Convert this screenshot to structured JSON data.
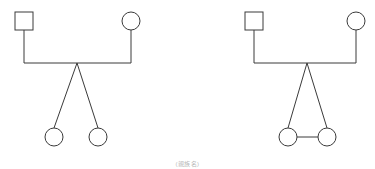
{
  "page": {
    "background_color": "#ffffff",
    "line_color": "#3a3a3a",
    "shape_fill": "#ffffff",
    "width": 375,
    "height": 169
  },
  "caption": {
    "text": "(親族名)",
    "color": "#b9b9b9"
  },
  "diagrams": [
    {
      "id": "left-diagram",
      "name": "diagram-left",
      "label": "Two unrelated daughters",
      "nodes": [
        {
          "id": "father",
          "name": "father-square",
          "symbol": "square",
          "sex": "male",
          "cx": 24,
          "cy": 21,
          "size": 18
        },
        {
          "id": "mother",
          "name": "mother-circle",
          "symbol": "circle",
          "sex": "female",
          "cx": 131,
          "cy": 21,
          "r": 9
        },
        {
          "id": "child1",
          "name": "child-1-circle",
          "symbol": "circle",
          "sex": "female",
          "cx": 54,
          "cy": 137,
          "r": 9
        },
        {
          "id": "child2",
          "name": "child-2-circle",
          "symbol": "circle",
          "sex": "female",
          "cx": 98,
          "cy": 137,
          "r": 9
        }
      ],
      "links": [
        {
          "id": "father-drop",
          "name": "father-descent-line",
          "type": "vertical",
          "x": 24,
          "y1": 30,
          "y2": 63
        },
        {
          "id": "mother-drop",
          "name": "mother-descent-line",
          "type": "vertical",
          "x": 131,
          "y1": 30,
          "y2": 63
        },
        {
          "id": "union-line",
          "name": "marriage-line",
          "type": "horizontal",
          "y": 63,
          "x1": 24,
          "x2": 131
        },
        {
          "id": "sib-1",
          "name": "sibling-line-1",
          "type": "diagonal",
          "x1": 77,
          "y1": 63,
          "x2": 54,
          "y2": 128
        },
        {
          "id": "sib-2",
          "name": "sibling-line-2",
          "type": "diagonal",
          "x1": 77,
          "y1": 63,
          "x2": 98,
          "y2": 128
        }
      ]
    },
    {
      "id": "right-diagram",
      "name": "diagram-right",
      "label": "Two daughters joined by a union line",
      "nodes": [
        {
          "id": "father",
          "name": "father-square",
          "symbol": "square",
          "sex": "male",
          "cx": 254,
          "cy": 21,
          "size": 18
        },
        {
          "id": "mother",
          "name": "mother-circle",
          "symbol": "circle",
          "sex": "female",
          "cx": 356,
          "cy": 21,
          "r": 9
        },
        {
          "id": "child1",
          "name": "child-1-circle",
          "symbol": "circle",
          "sex": "female",
          "cx": 288,
          "cy": 137,
          "r": 9
        },
        {
          "id": "child2",
          "name": "child-2-circle",
          "symbol": "circle",
          "sex": "female",
          "cx": 327,
          "cy": 137,
          "r": 9
        }
      ],
      "links": [
        {
          "id": "father-drop",
          "name": "father-descent-line",
          "type": "vertical",
          "x": 254,
          "y1": 30,
          "y2": 63
        },
        {
          "id": "mother-drop",
          "name": "mother-descent-line",
          "type": "vertical",
          "x": 356,
          "y1": 30,
          "y2": 63
        },
        {
          "id": "union-line",
          "name": "marriage-line",
          "type": "horizontal",
          "y": 63,
          "x1": 254,
          "x2": 356
        },
        {
          "id": "sib-1",
          "name": "sibling-line-1",
          "type": "diagonal",
          "x1": 307,
          "y1": 63,
          "x2": 288,
          "y2": 128
        },
        {
          "id": "sib-2",
          "name": "sibling-line-2",
          "type": "diagonal",
          "x1": 307,
          "y1": 63,
          "x2": 327,
          "y2": 128
        },
        {
          "id": "child-union",
          "name": "children-union-line",
          "type": "horizontal",
          "y": 137,
          "x1": 297,
          "x2": 318
        }
      ]
    }
  ]
}
